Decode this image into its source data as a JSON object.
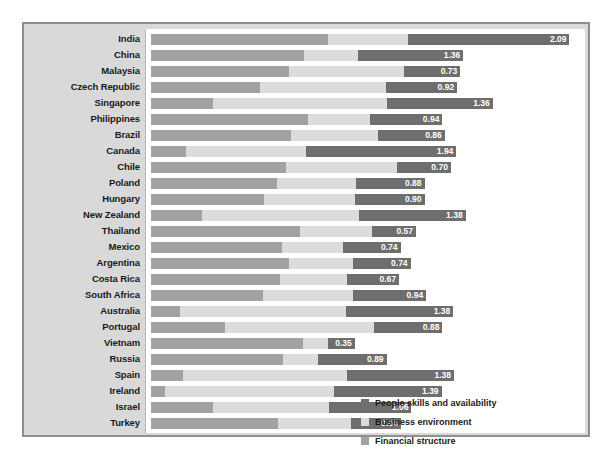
{
  "chart_data": {
    "type": "bar",
    "subtype": "horizontal-stacked-bar",
    "title": "",
    "xlabel": "",
    "ylabel": "",
    "grid": false,
    "legend_position": "bottom-right",
    "categories": [
      "India",
      "China",
      "Malaysia",
      "Czech Republic",
      "Singapore",
      "Philippines",
      "Brazil",
      "Canada",
      "Chile",
      "Poland",
      "Hungary",
      "New Zealand",
      "Thailand",
      "Mexico",
      "Argentina",
      "Costa Rica",
      "South Africa",
      "Australia",
      "Portugal",
      "Vietnam",
      "Russia",
      "Spain",
      "Ireland",
      "Israel",
      "Turkey"
    ],
    "series": [
      {
        "name": "Financial structure",
        "color": "#a2a2a2",
        "values": [
          2.29,
          1.97,
          1.78,
          1.4,
          0.8,
          2.02,
          1.81,
          0.45,
          1.74,
          1.63,
          1.46,
          0.66,
          1.92,
          1.69,
          1.78,
          1.66,
          1.45,
          0.38,
          0.96,
          1.96,
          1.7,
          0.41,
          0.18,
          0.8,
          1.64
        ]
      },
      {
        "name": "Business environment",
        "color": "#dcdcdc",
        "values": [
          1.02,
          0.7,
          1.48,
          1.63,
          2.25,
          0.8,
          1.12,
          1.55,
          1.43,
          1.02,
          1.17,
          2.02,
          0.93,
          0.79,
          0.83,
          0.87,
          1.16,
          2.14,
          1.92,
          0.32,
          0.45,
          2.12,
          2.18,
          1.5,
          0.94
        ]
      },
      {
        "name": "People skills and availability",
        "color": "#6e6e6e",
        "values": [
          2.09,
          1.36,
          0.73,
          0.92,
          1.36,
          0.94,
          0.86,
          1.94,
          0.7,
          0.88,
          0.9,
          1.38,
          0.57,
          0.74,
          0.74,
          0.67,
          0.94,
          1.38,
          0.88,
          0.35,
          0.89,
          1.38,
          1.39,
          1.06,
          0.64
        ]
      }
    ],
    "labeled_series": "People skills and availability",
    "value_labels": [
      "2.09",
      "1.36",
      "0.73",
      "0.92",
      "1.36",
      "0.94",
      "0.86",
      "1.94",
      "0.70",
      "0.88",
      "0.90",
      "1.38",
      "0.57",
      "0.74",
      "0.74",
      "0.67",
      "0.94",
      "1.38",
      "0.88",
      "0.35",
      "0.89",
      "1.38",
      "1.39",
      "1.06",
      "0.64"
    ],
    "xlim": [
      0,
      5.6
    ],
    "stack_order": [
      "Financial structure",
      "Business environment",
      "People skills and availability"
    ]
  },
  "legend": {
    "items": [
      {
        "label": "People skills and availability",
        "color": "#6e6e6e"
      },
      {
        "label": "Business environment",
        "color": "#dcdcdc"
      },
      {
        "label": "Financial structure",
        "color": "#a2a2a2"
      }
    ]
  },
  "colors": {
    "frame_background": "#d9d9d9",
    "frame_border": "#8e8e8e",
    "plot_background": "#ffffff",
    "label_text": "#1a1a1a",
    "value_text": "#ffffff"
  }
}
